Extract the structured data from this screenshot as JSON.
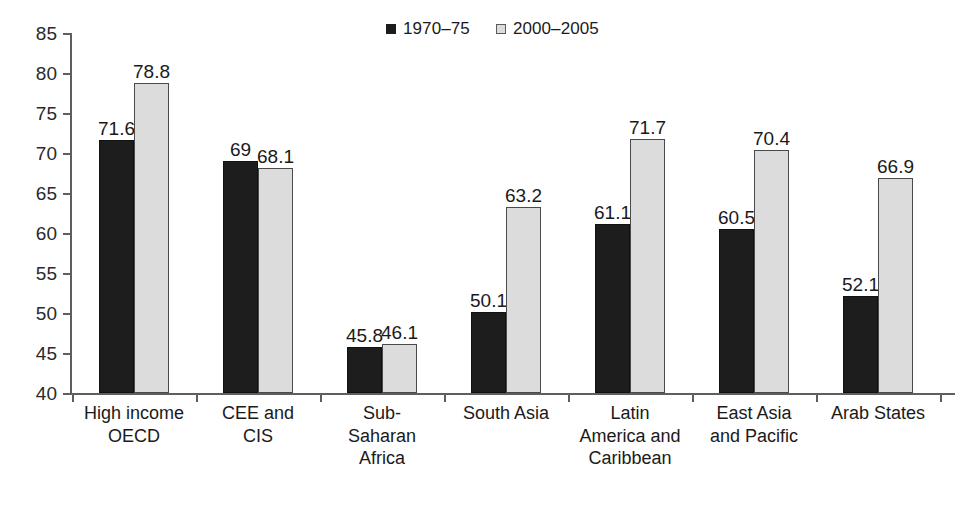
{
  "chart_data": {
    "type": "bar",
    "title": "",
    "subtitle": "",
    "xlabel": "",
    "ylabel": "",
    "ylim": [
      40,
      85
    ],
    "ytick_values": [
      85,
      80,
      75,
      70,
      65,
      60,
      55,
      50,
      45,
      40
    ],
    "ytick_labels": [
      "85",
      "80",
      "75",
      "70",
      "65",
      "60",
      "55",
      "50",
      "45",
      "40"
    ],
    "grid": false,
    "legend_position": "top-center",
    "categories": [
      "High income OECD",
      "CEE and CIS",
      "Sub-Saharan Africa",
      "South Asia",
      "Latin America and Caribbean",
      "East Asia and Pacific",
      "Arab States"
    ],
    "category_lines": [
      [
        "High income",
        "OECD"
      ],
      [
        "CEE and",
        "CIS"
      ],
      [
        "Sub-",
        "Saharan",
        "Africa"
      ],
      [
        "South Asia"
      ],
      [
        "Latin",
        "America and",
        "Caribbean"
      ],
      [
        "East Asia",
        "and Pacific"
      ],
      [
        "Arab States"
      ]
    ],
    "series": [
      {
        "name": "1970–75",
        "color": "#1d1d1d",
        "values": [
          71.6,
          69,
          45.8,
          50.1,
          61.1,
          60.5,
          52.1
        ],
        "value_labels": [
          "71.6",
          "69",
          "45.8",
          "50.1",
          "61.1",
          "60.5",
          "52.1"
        ]
      },
      {
        "name": "2000–2005",
        "color": "#dcdcdc",
        "values": [
          78.8,
          68.1,
          46.1,
          63.2,
          71.7,
          70.4,
          66.9
        ],
        "value_labels": [
          "78.8",
          "68.1",
          "46.1",
          "63.2",
          "71.7",
          "70.4",
          "66.9"
        ]
      }
    ]
  },
  "legend": {
    "entries": [
      {
        "label": "1970–75",
        "swatch": "dark-square-swatch"
      },
      {
        "label": "2000–2005",
        "swatch": "light-square-swatch"
      }
    ]
  }
}
